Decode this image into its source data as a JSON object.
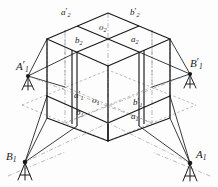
{
  "figure": {
    "kind": "isometric-survey-diagram",
    "colors": {
      "solid_line": "#1a1a1a",
      "dashed_line": "#6e6e6e",
      "dash_dot_line": "#8a8a8a",
      "label_text": "#1a1a1a",
      "background": "#fdfdfd"
    }
  },
  "stations": [
    {
      "id": "A1p",
      "letter": "A",
      "prime": "′",
      "sub": "1",
      "x": 16,
      "y": 60,
      "anchor_x": 28,
      "anchor_y": 76
    },
    {
      "id": "B1p",
      "letter": "B",
      "prime": "′",
      "sub": "1",
      "x": 190,
      "y": 57,
      "anchor_x": 190,
      "anchor_y": 74
    },
    {
      "id": "B1",
      "letter": "B",
      "prime": "",
      "sub": "1",
      "x": 6,
      "y": 150,
      "anchor_x": 25,
      "anchor_y": 162
    },
    {
      "id": "A1",
      "letter": "A",
      "prime": "",
      "sub": "1",
      "x": 196,
      "y": 148,
      "anchor_x": 190,
      "anchor_y": 163
    }
  ],
  "nodes_upper": [
    {
      "id": "a2p",
      "letter": "a",
      "prime": "′",
      "sub": "2",
      "x": 61,
      "y": 7
    },
    {
      "id": "b2p",
      "letter": "b",
      "prime": "′",
      "sub": "2",
      "x": 130,
      "y": 7
    },
    {
      "id": "o2",
      "letter": "o",
      "prime": "",
      "sub": "2",
      "x": 99,
      "y": 22
    },
    {
      "id": "b2",
      "letter": "b",
      "prime": "",
      "sub": "2",
      "x": 75,
      "y": 35
    },
    {
      "id": "a2",
      "letter": "a",
      "prime": "",
      "sub": "2",
      "x": 131,
      "y": 34
    }
  ],
  "nodes_lower": [
    {
      "id": "a1p",
      "letter": "a",
      "prime": "′",
      "sub": "1",
      "x": 74,
      "y": 90
    },
    {
      "id": "o1",
      "letter": "o",
      "prime": "",
      "sub": "1",
      "x": 92,
      "y": 95
    },
    {
      "id": "b1p",
      "letter": "b",
      "prime": "′",
      "sub": "1",
      "x": 133,
      "y": 97
    },
    {
      "id": "b1",
      "letter": "b",
      "prime": "",
      "sub": "1",
      "x": 76,
      "y": 107
    },
    {
      "id": "a1",
      "letter": "a",
      "prime": "",
      "sub": "1",
      "x": 131,
      "y": 111
    }
  ]
}
